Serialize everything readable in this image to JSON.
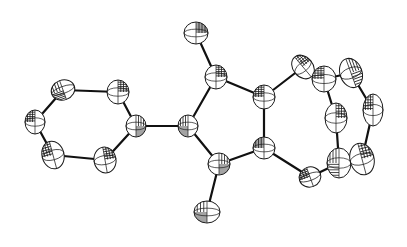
{
  "figure": {
    "type": "ORTEP thermal ellipsoid plot",
    "colors": {
      "ink": "#1a1a1a",
      "background": "#ffffff"
    }
  },
  "atoms": [
    {
      "id": "a1",
      "group": "phenyl",
      "x": 63,
      "y": 90,
      "rx": 12,
      "ry": 10,
      "rot": -20
    },
    {
      "id": "a2",
      "group": "phenyl",
      "x": 118,
      "y": 92,
      "rx": 11,
      "ry": 12,
      "rot": 0
    },
    {
      "id": "a3",
      "group": "phenyl",
      "x": 35,
      "y": 122,
      "rx": 10,
      "ry": 12,
      "rot": 0
    },
    {
      "id": "a4",
      "group": "phenyl",
      "x": 136,
      "y": 126,
      "rx": 10,
      "ry": 11,
      "rot": 0
    },
    {
      "id": "a5",
      "group": "phenyl",
      "x": 53,
      "y": 155,
      "rx": 11,
      "ry": 14,
      "rot": -15
    },
    {
      "id": "a6",
      "group": "phenyl",
      "x": 105,
      "y": 160,
      "rx": 11,
      "ry": 13,
      "rot": -10
    },
    {
      "id": "a7",
      "group": "core",
      "x": 188,
      "y": 126,
      "rx": 10,
      "ry": 11,
      "rot": 0
    },
    {
      "id": "a8",
      "group": "core",
      "x": 216,
      "y": 77,
      "rx": 11,
      "ry": 12,
      "rot": 0
    },
    {
      "id": "a9",
      "group": "core",
      "x": 264,
      "y": 97,
      "rx": 11,
      "ry": 12,
      "rot": 0
    },
    {
      "id": "a10",
      "group": "core",
      "x": 219,
      "y": 164,
      "rx": 11,
      "ry": 11,
      "rot": 0
    },
    {
      "id": "a11",
      "group": "core",
      "x": 264,
      "y": 148,
      "rx": 11,
      "ry": 11,
      "rot": 0
    },
    {
      "id": "a12",
      "group": "substituent",
      "x": 196,
      "y": 33,
      "rx": 12,
      "ry": 11,
      "rot": 0
    },
    {
      "id": "a13",
      "group": "substituent",
      "x": 207,
      "y": 212,
      "rx": 13,
      "ry": 11,
      "rot": 0
    },
    {
      "id": "a14",
      "group": "ring7",
      "x": 303,
      "y": 67,
      "rx": 10,
      "ry": 13,
      "rot": -40
    },
    {
      "id": "a15",
      "group": "ring7",
      "x": 324,
      "y": 79,
      "rx": 12,
      "ry": 13,
      "rot": 0
    },
    {
      "id": "a16",
      "group": "ring7",
      "x": 351,
      "y": 73,
      "rx": 11,
      "ry": 15,
      "rot": -20
    },
    {
      "id": "a17",
      "group": "ring7",
      "x": 373,
      "y": 110,
      "rx": 10,
      "ry": 16,
      "rot": 0
    },
    {
      "id": "a18",
      "group": "ring7",
      "x": 336,
      "y": 118,
      "rx": 11,
      "ry": 15,
      "rot": 0
    },
    {
      "id": "a19",
      "group": "ring7",
      "x": 339,
      "y": 163,
      "rx": 12,
      "ry": 15,
      "rot": 0
    },
    {
      "id": "a20",
      "group": "ring7",
      "x": 362,
      "y": 159,
      "rx": 12,
      "ry": 16,
      "rot": -15
    },
    {
      "id": "a21",
      "group": "ring7",
      "x": 310,
      "y": 177,
      "rx": 11,
      "ry": 10,
      "rot": -20
    }
  ],
  "bonds": [
    [
      "a1",
      "a2"
    ],
    [
      "a1",
      "a3"
    ],
    [
      "a3",
      "a5"
    ],
    [
      "a5",
      "a6"
    ],
    [
      "a6",
      "a4"
    ],
    [
      "a4",
      "a2"
    ],
    [
      "a4",
      "a7"
    ],
    [
      "a7",
      "a8"
    ],
    [
      "a8",
      "a9"
    ],
    [
      "a9",
      "a11"
    ],
    [
      "a11",
      "a10"
    ],
    [
      "a10",
      "a7"
    ],
    [
      "a8",
      "a12"
    ],
    [
      "a10",
      "a13"
    ],
    [
      "a9",
      "a14"
    ],
    [
      "a14",
      "a15"
    ],
    [
      "a15",
      "a16"
    ],
    [
      "a16",
      "a17"
    ],
    [
      "a17",
      "a20"
    ],
    [
      "a15",
      "a18"
    ],
    [
      "a18",
      "a19"
    ],
    [
      "a19",
      "a20"
    ],
    [
      "a11",
      "a21"
    ],
    [
      "a21",
      "a19"
    ]
  ]
}
